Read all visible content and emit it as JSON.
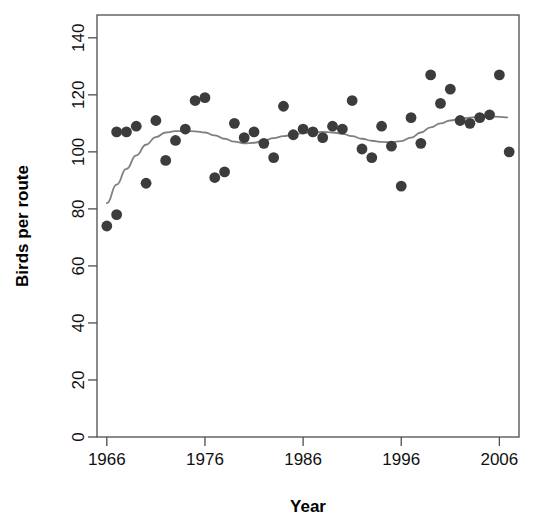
{
  "chart_data": {
    "type": "scatter",
    "title": "",
    "xlabel": "Year",
    "ylabel": "Birds per route",
    "xlim": [
      1965.0,
      2008.0
    ],
    "ylim": [
      0,
      148
    ],
    "grid": false,
    "legend": "none",
    "xticks": [
      1966,
      1976,
      1986,
      1996,
      2006
    ],
    "yticks": [
      0,
      20,
      40,
      60,
      80,
      100,
      120,
      140
    ],
    "marker_color": "#3c3c3c",
    "trend_line_color": "#808080",
    "axis_color": "#4d4d4d",
    "x": [
      1966,
      1967,
      1967,
      1968,
      1969,
      1970,
      1971,
      1972,
      1973,
      1974,
      1975,
      1976,
      1977,
      1978,
      1979,
      1980,
      1981,
      1982,
      1983,
      1984,
      1985,
      1986,
      1987,
      1988,
      1989,
      1990,
      1991,
      1992,
      1993,
      1994,
      1995,
      1996,
      1997,
      1998,
      1999,
      2000,
      2001,
      2002,
      2003,
      2004,
      2005,
      2006,
      2007
    ],
    "y": [
      74,
      78,
      107,
      107,
      109,
      89,
      111,
      97,
      104,
      108,
      118,
      119,
      91,
      93,
      110,
      105,
      107,
      103,
      98,
      116,
      106,
      108,
      107,
      105,
      109,
      108,
      118,
      101,
      98,
      109,
      102,
      88,
      112,
      103,
      127,
      117,
      122,
      111,
      110,
      112,
      113,
      127,
      100
    ],
    "series_name": "Birds per route",
    "trend": {
      "name": "loess smooth",
      "x": [
        1966.0,
        1967.0,
        1968.0,
        1969.0,
        1970.0,
        1971.0,
        1972.0,
        1973.0,
        1974.0,
        1975.0,
        1976.0,
        1977.0,
        1978.0,
        1979.0,
        1980.0,
        1981.0,
        1982.0,
        1983.0,
        1984.0,
        1985.0,
        1986.0,
        1987.0,
        1988.0,
        1989.0,
        1990.0,
        1991.0,
        1992.0,
        1993.0,
        1994.0,
        1995.0,
        1996.0,
        1997.0,
        1998.0,
        1999.0,
        2000.0,
        2001.0,
        2002.0,
        2003.0,
        2004.0,
        2005.0,
        2006.0,
        2006.8
      ],
      "y": [
        82.0,
        88.5,
        94.0,
        98.8,
        102.5,
        105.2,
        106.8,
        107.3,
        107.3,
        107.2,
        106.8,
        105.8,
        104.6,
        103.6,
        103.0,
        103.2,
        104.0,
        104.8,
        105.5,
        106.1,
        106.6,
        106.9,
        107.0,
        106.8,
        106.3,
        105.5,
        104.6,
        103.9,
        103.5,
        103.4,
        103.8,
        105.0,
        106.8,
        108.6,
        110.0,
        111.0,
        111.6,
        112.0,
        112.3,
        112.4,
        112.3,
        112.1
      ]
    }
  },
  "axes": {
    "y_title": "Birds per route",
    "x_title": "Year",
    "y_tick_labels": [
      "0",
      "20",
      "40",
      "60",
      "80",
      "100",
      "120",
      "140"
    ],
    "x_tick_labels": [
      "1966",
      "1976",
      "1986",
      "1996",
      "2006"
    ]
  }
}
